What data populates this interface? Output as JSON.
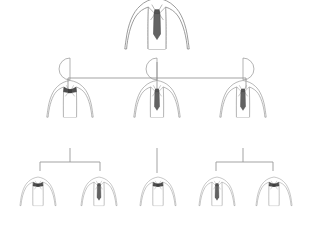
{
  "diagram": {
    "type": "org-chart",
    "canvas": {
      "width": 315,
      "height": 239
    },
    "style": {
      "background": "#ffffff",
      "line_color": "#999999",
      "line_width": 0.9,
      "figure_stroke": "#8a8a8a",
      "figure_stroke_light": "#b0b0b0",
      "tie_dark": "#5f5f5f",
      "tie_mid": "#6e6e6e",
      "bowtie_color": "#4f4f4f",
      "shirt_fill": "#ffffff"
    },
    "levels": [
      {
        "level": 1,
        "name": "executive",
        "nodes": [
          {
            "id": "n1",
            "label": "Executive",
            "head_style": "full-circle",
            "neckwear": "necktie",
            "scale": 1.0,
            "x": 157,
            "y": 14
          }
        ]
      },
      {
        "level": 2,
        "name": "managers",
        "nodes": [
          {
            "id": "n2",
            "label": "Manager Left",
            "head_style": "half-circle-left",
            "neckwear": "bowtie",
            "scale": 0.72,
            "x": 70,
            "y": 92
          },
          {
            "id": "n3",
            "label": "Manager Center",
            "head_style": "half-circle-left",
            "neckwear": "necktie",
            "scale": 0.72,
            "x": 157,
            "y": 92
          },
          {
            "id": "n4",
            "label": "Manager Right",
            "head_style": "half-circle-right",
            "neckwear": "necktie",
            "scale": 0.72,
            "x": 243,
            "y": 92
          }
        ]
      },
      {
        "level": 3,
        "name": "staff",
        "nodes": [
          {
            "id": "n5",
            "label": "Staff One",
            "head_style": "none",
            "neckwear": "bowtie",
            "scale": 0.56,
            "x": 38,
            "y": 186
          },
          {
            "id": "n6",
            "label": "Staff Two",
            "head_style": "none",
            "neckwear": "necktie",
            "scale": 0.56,
            "x": 99,
            "y": 186
          },
          {
            "id": "n7",
            "label": "Staff Three",
            "head_style": "none",
            "neckwear": "bowtie",
            "scale": 0.56,
            "x": 158,
            "y": 186
          },
          {
            "id": "n8",
            "label": "Staff Four",
            "head_style": "none",
            "neckwear": "necktie",
            "scale": 0.56,
            "x": 217,
            "y": 186
          },
          {
            "id": "n9",
            "label": "Staff Five",
            "head_style": "none",
            "neckwear": "bowtie",
            "scale": 0.56,
            "x": 274,
            "y": 186
          }
        ]
      }
    ],
    "connectors": [
      {
        "id": "c1",
        "name": "root-stem",
        "from": "n1",
        "to": "bus-1",
        "path": "M157,62 L157,78"
      },
      {
        "id": "c2",
        "name": "level2-bus",
        "from": "bus-1",
        "to": "level2",
        "path": "M68,78 L246,78"
      },
      {
        "id": "c3",
        "name": "drop-left",
        "from": "bus-1",
        "to": "n2",
        "path": "M68,78 L68,90"
      },
      {
        "id": "c4",
        "name": "drop-center",
        "from": "bus-1",
        "to": "n3",
        "path": "M157,78 L157,90"
      },
      {
        "id": "c5",
        "name": "drop-right",
        "from": "bus-1",
        "to": "n4",
        "path": "M246,78 L246,90"
      },
      {
        "id": "c6",
        "name": "left-stem",
        "from": "n2",
        "to": "bus-2",
        "path": "M70,148 L70,162"
      },
      {
        "id": "c7",
        "name": "left-bus",
        "from": "bus-2",
        "to": "staff-left",
        "path": "M40,162 L100,162"
      },
      {
        "id": "c8",
        "name": "left-drop-1",
        "from": "bus-2",
        "to": "n5",
        "path": "M40,162 L40,171"
      },
      {
        "id": "c9",
        "name": "left-drop-2",
        "from": "bus-2",
        "to": "n6",
        "path": "M100,162 L100,171"
      },
      {
        "id": "c10",
        "name": "center-stem",
        "from": "n3",
        "to": "n7",
        "path": "M157,148 L157,173"
      },
      {
        "id": "c11",
        "name": "right-stem",
        "from": "n4",
        "to": "bus-3",
        "path": "M243,148 L243,162"
      },
      {
        "id": "c12",
        "name": "right-bus",
        "from": "bus-3",
        "to": "staff-right",
        "path": "M216,162 L273,162"
      },
      {
        "id": "c13",
        "name": "right-drop-1",
        "from": "bus-3",
        "to": "n8",
        "path": "M216,162 L216,171"
      },
      {
        "id": "c14",
        "name": "right-drop-2",
        "from": "bus-3",
        "to": "n9",
        "path": "M273,162 L273,171"
      }
    ]
  }
}
